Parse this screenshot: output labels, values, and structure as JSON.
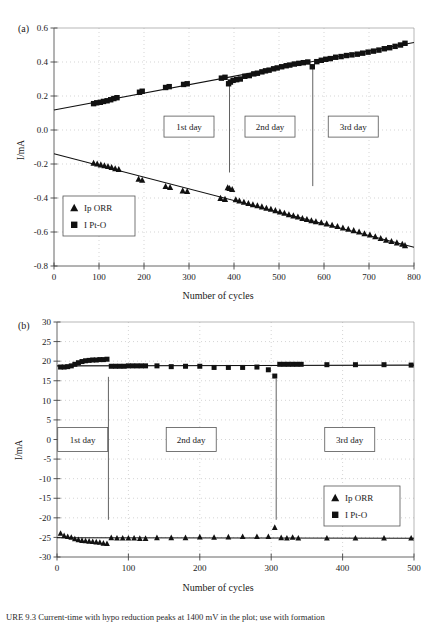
{
  "figure": {
    "caption": "URE 9.3   Current-time with hypo reduction peaks at 1400 mV in the plot; use with formation",
    "panels": [
      {
        "tag": "(a)"
      },
      {
        "tag": "(b)"
      }
    ]
  },
  "chart_data": [
    {
      "type": "scatter",
      "panel": "(a)",
      "title": "",
      "xlabel": "Number of cycles",
      "ylabel": "I/mA",
      "xlim": [
        0,
        800
      ],
      "ylim": [
        -0.8,
        0.6
      ],
      "xticks": [
        0,
        100,
        200,
        300,
        400,
        500,
        600,
        700,
        800
      ],
      "yticks": [
        0.6,
        0.4,
        0.2,
        0.0,
        -0.2,
        -0.4,
        -0.6,
        -0.8
      ],
      "xtick_labels": [
        "0",
        "100",
        "200",
        "300",
        "400",
        "500",
        "600",
        "700",
        "800"
      ],
      "ytick_labels": [
        "0.6",
        "0.4",
        "0.2",
        "0.0",
        "-0.2",
        "-0.4",
        "-0.6",
        "-0.8"
      ],
      "grid": "dotted-vertical-and-horizontal",
      "legend_position": "lower-left",
      "legend": [
        {
          "label": "Ip ORR",
          "marker": "triangle"
        },
        {
          "label": "I Pt-O",
          "marker": "square"
        }
      ],
      "annotations": [
        {
          "text": "1st day",
          "x": 300,
          "y": 0.02,
          "type": "box"
        },
        {
          "text": "2nd day",
          "x": 480,
          "y": 0.02,
          "type": "box"
        },
        {
          "text": "3rd day",
          "x": 665,
          "y": 0.02,
          "type": "box"
        }
      ],
      "dividers": [
        {
          "x": 390,
          "y_from": 0.28,
          "y_to": -0.25
        },
        {
          "x": 575,
          "y_from": 0.36,
          "y_to": -0.33
        }
      ],
      "trendlines": [
        {
          "name": "I Pt-O",
          "x": [
            0,
            800
          ],
          "y": [
            0.118,
            0.515
          ]
        },
        {
          "name": "Ip ORR",
          "x": [
            0,
            800
          ],
          "y": [
            -0.14,
            -0.69
          ]
        }
      ],
      "series": [
        {
          "name": "I Pt-O",
          "marker": "square",
          "x": [
            88,
            95,
            103,
            110,
            118,
            126,
            133,
            140,
            190,
            196,
            248,
            256,
            288,
            296,
            372,
            380,
            388,
            392,
            398,
            406,
            414,
            424,
            434,
            444,
            452,
            462,
            470,
            478,
            488,
            496,
            506,
            516,
            524,
            534,
            544,
            554,
            564,
            574,
            584,
            594,
            604,
            614,
            626,
            638,
            650,
            662,
            674,
            686,
            698,
            710,
            722,
            734,
            746,
            758,
            770,
            780
          ],
          "y": [
            0.155,
            0.16,
            0.163,
            0.168,
            0.172,
            0.178,
            0.185,
            0.19,
            0.222,
            0.228,
            0.25,
            0.255,
            0.268,
            0.272,
            0.305,
            0.31,
            0.272,
            0.282,
            0.292,
            0.296,
            0.3,
            0.316,
            0.32,
            0.33,
            0.334,
            0.342,
            0.348,
            0.352,
            0.36,
            0.365,
            0.372,
            0.378,
            0.382,
            0.388,
            0.392,
            0.396,
            0.4,
            0.372,
            0.402,
            0.41,
            0.416,
            0.42,
            0.428,
            0.432,
            0.438,
            0.442,
            0.446,
            0.452,
            0.458,
            0.464,
            0.47,
            0.478,
            0.484,
            0.492,
            0.5,
            0.51
          ]
        },
        {
          "name": "Ip ORR",
          "marker": "triangle",
          "x": [
            88,
            96,
            104,
            112,
            120,
            128,
            136,
            144,
            188,
            196,
            248,
            258,
            286,
            296,
            370,
            380,
            386,
            390,
            396,
            404,
            412,
            422,
            432,
            442,
            452,
            462,
            472,
            482,
            492,
            502,
            512,
            522,
            532,
            542,
            552,
            562,
            572,
            582,
            594,
            606,
            618,
            630,
            642,
            654,
            666,
            678,
            690,
            702,
            714,
            726,
            738,
            750,
            762,
            774,
            780
          ],
          "y": [
            -0.195,
            -0.2,
            -0.205,
            -0.21,
            -0.215,
            -0.22,
            -0.228,
            -0.232,
            -0.29,
            -0.296,
            -0.332,
            -0.338,
            -0.358,
            -0.362,
            -0.402,
            -0.408,
            -0.34,
            -0.344,
            -0.35,
            -0.41,
            -0.418,
            -0.425,
            -0.432,
            -0.44,
            -0.446,
            -0.452,
            -0.46,
            -0.466,
            -0.474,
            -0.482,
            -0.49,
            -0.498,
            -0.505,
            -0.512,
            -0.52,
            -0.526,
            -0.534,
            -0.54,
            -0.546,
            -0.552,
            -0.56,
            -0.568,
            -0.576,
            -0.584,
            -0.592,
            -0.6,
            -0.61,
            -0.618,
            -0.628,
            -0.638,
            -0.648,
            -0.656,
            -0.664,
            -0.672,
            -0.68
          ]
        }
      ]
    },
    {
      "type": "scatter",
      "panel": "(b)",
      "title": "",
      "xlabel": "Number of cycles",
      "ylabel": "I/mA",
      "xlim": [
        0,
        500
      ],
      "ylim": [
        -30,
        30
      ],
      "xticks": [
        0,
        100,
        200,
        300,
        400,
        500
      ],
      "yticks": [
        30,
        25,
        20,
        15,
        10,
        5,
        0,
        -5,
        -10,
        -15,
        -20,
        -25,
        -30
      ],
      "xtick_labels": [
        "0",
        "100",
        "200",
        "300",
        "400",
        "500"
      ],
      "ytick_labels": [
        "30",
        "25",
        "20",
        "15",
        "10",
        "5",
        "0",
        "-5",
        "-10",
        "-15",
        "-20",
        "-25",
        "-30"
      ],
      "grid": "dotted-vertical-and-horizontal",
      "legend_position": "lower-right",
      "legend": [
        {
          "label": "Ip ORR",
          "marker": "triangle"
        },
        {
          "label": "I Pt-O",
          "marker": "square"
        }
      ],
      "annotations": [
        {
          "text": "1st day",
          "x": 36,
          "y": 0,
          "type": "box"
        },
        {
          "text": "2nd day",
          "x": 188,
          "y": 0,
          "type": "box"
        },
        {
          "text": "3rd day",
          "x": 410,
          "y": 0,
          "type": "box"
        }
      ],
      "dividers": [
        {
          "x": 72,
          "y_from": 16,
          "y_to": -20.5
        },
        {
          "x": 307,
          "y_from": 15.5,
          "y_to": -20.5
        }
      ],
      "trendlines": [
        {
          "name": "I Pt-O",
          "x": [
            0,
            500
          ],
          "y": [
            18.8,
            19.0
          ]
        },
        {
          "name": "Ip ORR",
          "x": [
            0,
            500
          ],
          "y": [
            -25.1,
            -25.2
          ]
        }
      ],
      "series": [
        {
          "name": "I Pt-O",
          "marker": "square",
          "x": [
            5,
            10,
            15,
            20,
            25,
            30,
            35,
            40,
            45,
            50,
            55,
            60,
            65,
            70,
            76,
            82,
            88,
            94,
            100,
            106,
            112,
            118,
            124,
            140,
            160,
            180,
            200,
            220,
            240,
            260,
            280,
            296,
            305,
            312,
            318,
            324,
            330,
            336,
            342,
            378,
            418,
            458,
            496
          ],
          "y": [
            18.5,
            18.5,
            18.6,
            18.8,
            19.2,
            19.6,
            19.9,
            20.1,
            20.2,
            20.3,
            20.3,
            20.4,
            20.4,
            20.5,
            18.7,
            18.7,
            18.7,
            18.7,
            18.8,
            18.8,
            18.8,
            18.8,
            18.8,
            18.8,
            18.6,
            18.7,
            18.7,
            18.4,
            18.4,
            18.4,
            18.5,
            17.8,
            16.2,
            19.2,
            19.2,
            19.2,
            19.2,
            19.2,
            19.2,
            19.1,
            19.1,
            19.1,
            19.0
          ]
        },
        {
          "name": "Ip ORR",
          "marker": "triangle",
          "x": [
            5,
            10,
            15,
            20,
            25,
            30,
            35,
            40,
            45,
            50,
            55,
            60,
            65,
            70,
            76,
            84,
            92,
            100,
            108,
            116,
            124,
            140,
            160,
            180,
            200,
            220,
            240,
            260,
            280,
            296,
            305,
            314,
            322,
            330,
            338,
            378,
            418,
            458,
            496
          ],
          "y": [
            -24.0,
            -24.6,
            -24.8,
            -25.0,
            -25.4,
            -25.6,
            -25.8,
            -25.9,
            -26.0,
            -26.1,
            -26.2,
            -26.3,
            -26.5,
            -26.6,
            -25.1,
            -25.2,
            -25.2,
            -25.2,
            -25.2,
            -25.3,
            -25.3,
            -25.1,
            -25.1,
            -25.1,
            -24.9,
            -25.0,
            -24.9,
            -24.8,
            -24.8,
            -24.8,
            -22.5,
            -25.1,
            -25.2,
            -25.0,
            -25.2,
            -25.2,
            -25.2,
            -25.2,
            -25.2
          ]
        }
      ]
    }
  ]
}
